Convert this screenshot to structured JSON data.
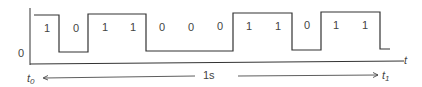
{
  "diagram": {
    "bits": [
      "1",
      "0",
      "1",
      "1",
      "0",
      "0",
      "0",
      "1",
      "1",
      "0",
      "1",
      "1"
    ],
    "y_axis_label": "0",
    "x_axis_label": "t",
    "start_label": "t0",
    "end_label": "t1",
    "duration_label": "1s",
    "line_color": "#333333"
  }
}
